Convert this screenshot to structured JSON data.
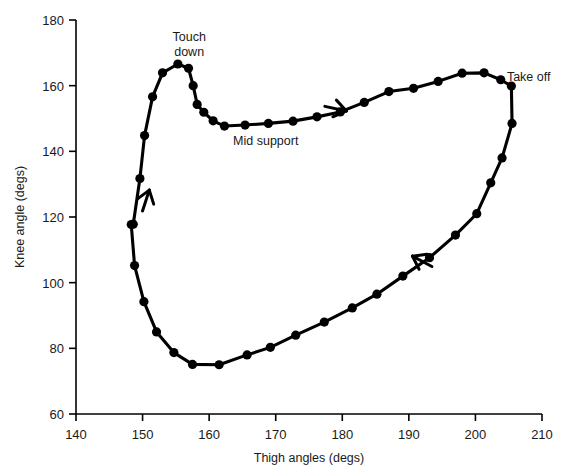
{
  "chart_data": {
    "type": "line",
    "title": "",
    "xlabel": "Thigh angles (degs)",
    "ylabel": "Knee angle (degs)",
    "xlim": [
      140,
      210
    ],
    "ylim": [
      60,
      180
    ],
    "xticks": [
      140,
      150,
      160,
      170,
      180,
      190,
      200,
      210
    ],
    "yticks": [
      60,
      80,
      100,
      120,
      140,
      160,
      180
    ],
    "grid": false,
    "legend": null,
    "marker": "filled-circle",
    "line_color": "#000000",
    "series": [
      {
        "name": "Thigh-knee angle-angle cycle",
        "x": [
          148.6,
          149.6,
          150.3,
          151.5,
          153.0,
          155.3,
          156.9,
          157.6,
          158.2,
          159.2,
          160.6,
          162.3,
          165.4,
          168.9,
          172.6,
          176.2,
          179.7,
          183.3,
          187.0,
          190.7,
          194.4,
          198.0,
          201.3,
          203.8,
          205.4,
          205.5,
          204.0,
          202.3,
          200.2,
          197.0,
          193.1,
          189.1,
          185.2,
          181.5,
          177.3,
          173.0,
          169.2,
          165.7,
          161.5,
          157.5,
          154.7,
          152.1,
          150.2,
          148.8,
          148.3
        ],
        "y": [
          117.8,
          131.7,
          144.8,
          156.6,
          163.9,
          166.6,
          165.3,
          160.0,
          154.3,
          151.9,
          149.3,
          147.7,
          148.0,
          148.5,
          149.2,
          150.5,
          152.0,
          154.9,
          158.2,
          159.2,
          161.3,
          163.8,
          163.9,
          161.8,
          159.9,
          148.5,
          138.0,
          130.4,
          121.0,
          114.5,
          107.6,
          102.0,
          96.5,
          92.3,
          88.0,
          84.0,
          80.3,
          78.0,
          75.0,
          75.1,
          78.7,
          85.0,
          94.2,
          105.2,
          117.7
        ]
      }
    ],
    "annotations": [
      {
        "name": "touch-down",
        "text_lines": [
          "Touch",
          "down"
        ],
        "x": 157.0,
        "y": 173.5
      },
      {
        "name": "mid-support",
        "text_lines": [
          "Mid support"
        ],
        "x": 168.5,
        "y": 142.0
      },
      {
        "name": "take-off",
        "text_lines": [
          "Take off"
        ],
        "x": 208.0,
        "y": 161.5
      }
    ],
    "direction_arrows": [
      {
        "name": "upward-direction-arrow",
        "x": 150.5,
        "y": 125.0,
        "angle_deg": -72
      },
      {
        "name": "rightward-direction-arrow",
        "x": 179.0,
        "y": 153.0,
        "angle_deg": 12
      },
      {
        "name": "downward-direction-arrow",
        "x": 192.0,
        "y": 106.5,
        "angle_deg": 208
      }
    ]
  }
}
